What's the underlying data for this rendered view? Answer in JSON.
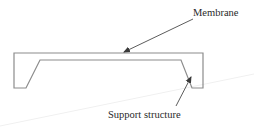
{
  "diagram": {
    "type": "cross-section schematic",
    "labels": {
      "membrane": "Membrane",
      "support": "Support structure"
    },
    "colors": {
      "outline": "#8c8c8c",
      "arrow": "#4a4a4a",
      "text": "#2a2a2a",
      "artifact": "#f0f0f0"
    },
    "shape": {
      "outline_points": "14,53 203,53 203,88 192,88 181,60 40,60 26,88 14,88"
    },
    "arrows": [
      {
        "name": "membrane-arrow",
        "from": [
          193,
          19
        ],
        "to": [
          124,
          52
        ],
        "target": "Membrane"
      },
      {
        "name": "support-arrow",
        "from": [
          176,
          106
        ],
        "to": [
          191,
          77
        ],
        "target": "Support structure"
      }
    ]
  }
}
